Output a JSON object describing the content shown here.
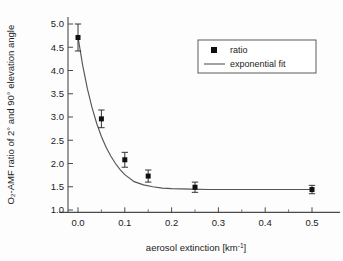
{
  "chart_data": {
    "type": "scatter",
    "title": "",
    "xlabel": "aerosol extinction [km",
    "xlabel_sup": "-1",
    "xlabel_suffix": "]",
    "ylabel": "O₂-AMF ratio of 2° and 90° elevation angle",
    "xlim": [
      -0.04,
      0.56
    ],
    "ylim": [
      0.95,
      5.15
    ],
    "xticks": [
      "0.0",
      "0.1",
      "0.2",
      "0.3",
      "0.4",
      "0.5"
    ],
    "xtick_values": [
      0.0,
      0.1,
      0.2,
      0.3,
      0.4,
      0.5
    ],
    "yticks": [
      "1.0",
      "1.5",
      "2.0",
      "2.5",
      "3.0",
      "3.5",
      "4.0",
      "4.5",
      "5.0"
    ],
    "ytick_values": [
      1.0,
      1.5,
      2.0,
      2.5,
      3.0,
      3.5,
      4.0,
      4.5,
      5.0
    ],
    "grid": false,
    "legend_position": "upper right",
    "series": [
      {
        "name": "ratio",
        "type": "scatter",
        "marker": "square",
        "color": "#101010",
        "x": [
          0.0,
          0.05,
          0.1,
          0.15,
          0.25,
          0.5
        ],
        "y": [
          4.71,
          2.96,
          2.08,
          1.73,
          1.49,
          1.44
        ],
        "yerr": [
          0.29,
          0.19,
          0.16,
          0.13,
          0.11,
          0.09
        ]
      },
      {
        "name": "exponential fit",
        "type": "line",
        "color": "#555555",
        "x": [
          0.0,
          0.01,
          0.02,
          0.03,
          0.04,
          0.05,
          0.06,
          0.07,
          0.08,
          0.09,
          0.1,
          0.12,
          0.14,
          0.16,
          0.18,
          0.2,
          0.24,
          0.28,
          0.32,
          0.36,
          0.4,
          0.45,
          0.5
        ],
        "y": [
          4.72,
          4.11,
          3.61,
          3.2,
          2.86,
          2.58,
          2.35,
          2.16,
          2.0,
          1.87,
          1.76,
          1.61,
          1.54,
          1.5,
          1.47,
          1.46,
          1.45,
          1.44,
          1.44,
          1.44,
          1.44,
          1.44,
          1.44
        ]
      }
    ]
  },
  "legend": {
    "entries": [
      {
        "label": "ratio",
        "symbol": "square-marker"
      },
      {
        "label": "exponential fit",
        "symbol": "line-segment"
      }
    ]
  }
}
